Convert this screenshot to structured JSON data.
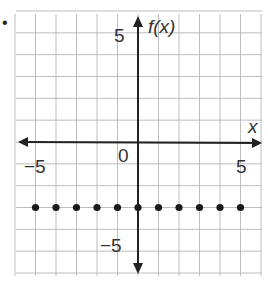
{
  "bullet": "•",
  "chart_data": {
    "type": "scatter",
    "title": "",
    "xlabel": "x",
    "ylabel": "f(x)",
    "xlim": [
      -6,
      6
    ],
    "ylim": [
      -6,
      6
    ],
    "grid": true,
    "x_tick_labels": [
      "-5",
      "0",
      "5"
    ],
    "y_tick_labels": [
      "5",
      "-5"
    ],
    "origin_label": "0",
    "series": [
      {
        "name": "f(x)",
        "x": [
          -5,
          -4,
          -3,
          -2,
          -1,
          0,
          1,
          2,
          3,
          4,
          5
        ],
        "y": [
          -3,
          -3,
          -3,
          -3,
          -3,
          -3,
          -3,
          -3,
          -3,
          -3,
          -3
        ]
      }
    ]
  },
  "labels": {
    "x_axis": "x",
    "y_axis": "f(x)",
    "x_neg5": "−5",
    "x_pos5": "5",
    "y_pos5": "5",
    "y_neg5": "−5",
    "origin": "0"
  },
  "colors": {
    "grid": "#bdbdbd",
    "axis": "#222222",
    "point": "#1a1a1a"
  }
}
